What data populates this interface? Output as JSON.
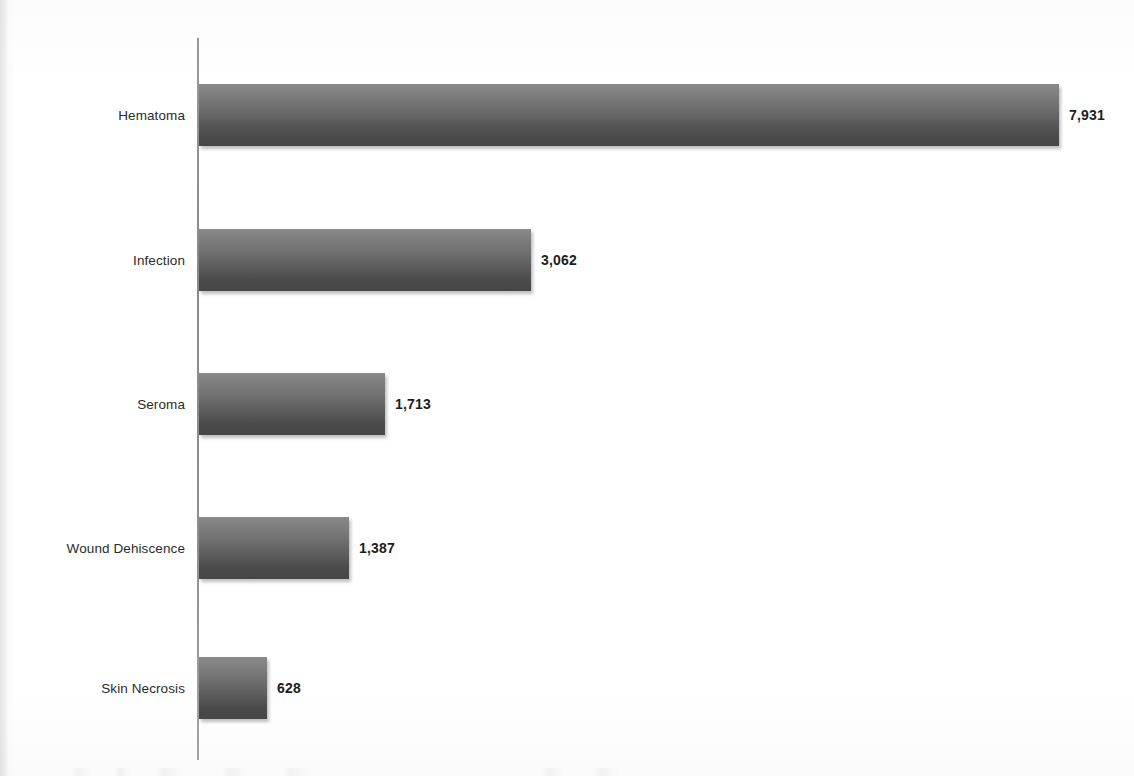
{
  "chart_data": {
    "type": "bar",
    "orientation": "horizontal",
    "title": "",
    "subtitle": "",
    "xlabel": "",
    "ylabel": "",
    "categories": [
      "Hematoma",
      "Infection",
      "Seroma",
      "Wound Dehiscence",
      "Skin Necrosis"
    ],
    "values": [
      7931,
      3062,
      1713,
      1387,
      628
    ],
    "value_labels": [
      "7,931",
      "3,062",
      "1,713",
      "1,387",
      "628"
    ],
    "series": [
      {
        "name": "",
        "values": [
          7931,
          3062,
          1713,
          1387,
          628
        ]
      }
    ],
    "xlim": [
      0,
      7931
    ],
    "grid": false,
    "legend": false,
    "legend_position": "none",
    "axis_visible": "value-axis-baseline-only",
    "tick_labels": [],
    "annotations": [],
    "bar_style": {
      "fill_top": "#8a8a8a",
      "fill_bottom": "#464646",
      "gradient_direction": "vertical",
      "shadow": true
    },
    "colors": {
      "background": "#ffffff",
      "bar_light": "#8a8a8a",
      "bar_dark": "#464646",
      "axis_line": "#8f8f8f",
      "category_label": "#2b2b2b",
      "value_label": "#1d1d1d",
      "page_edge": "#e4e4e4"
    }
  },
  "bars": [
    {
      "label": "Hematoma",
      "value_label": "7,931",
      "value": 7931
    },
    {
      "label": "Infection",
      "value_label": "3,062",
      "value": 3062
    },
    {
      "label": "Seroma",
      "value_label": "1,713",
      "value": 1713
    },
    {
      "label": "Wound Dehiscence",
      "value_label": "1,387",
      "value": 1387
    },
    {
      "label": "Skin Necrosis",
      "value_label": "628",
      "value": 628
    }
  ],
  "layout": {
    "axis_x": 199,
    "axis_top": 38,
    "axis_bottom": 760,
    "bar_height": 62,
    "px_per_unit": 0.10843,
    "row_tops": [
      84,
      229,
      373,
      517,
      657
    ],
    "value_label_gap": 10
  }
}
